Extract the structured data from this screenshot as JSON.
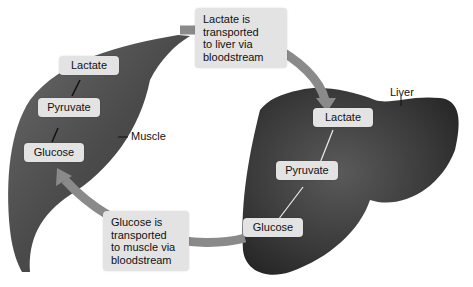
{
  "muscle": {
    "label": "Muscle",
    "steps": [
      "Lactate",
      "Pyruvate",
      "Glucose"
    ]
  },
  "liver": {
    "label": "Liver",
    "steps": [
      "Lactate",
      "Pyruvate",
      "Glucose"
    ]
  },
  "transport": {
    "to_liver": [
      "Lactate is",
      "transported",
      "to liver via",
      "bloodstream"
    ],
    "to_muscle": [
      "Glucose is",
      "transported",
      "to muscle via",
      "bloodstream"
    ]
  }
}
